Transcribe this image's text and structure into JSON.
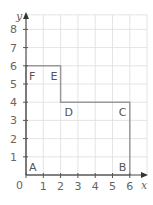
{
  "diagram": {
    "type": "coordinate-grid",
    "axes": {
      "x_label": "x",
      "y_label": "y",
      "origin_label": "0",
      "x_ticks": [
        "1",
        "2",
        "3",
        "4",
        "5",
        "6"
      ],
      "y_ticks": [
        "1",
        "2",
        "3",
        "4",
        "5",
        "6",
        "7",
        "8"
      ],
      "x_range": [
        0,
        7
      ],
      "y_range": [
        0,
        8.8
      ]
    },
    "points": [
      {
        "name": "A",
        "x": 0,
        "y": 0
      },
      {
        "name": "B",
        "x": 6,
        "y": 0
      },
      {
        "name": "C",
        "x": 6,
        "y": 4
      },
      {
        "name": "D",
        "x": 2,
        "y": 4
      },
      {
        "name": "E",
        "x": 2,
        "y": 6
      },
      {
        "name": "F",
        "x": 0,
        "y": 6
      }
    ],
    "shape_outline_order": [
      "A",
      "B",
      "C",
      "D",
      "E",
      "F"
    ],
    "colors": {
      "grid": "#dddddd",
      "axis": "#555555",
      "shape": "#999999",
      "text": "#666666"
    }
  }
}
